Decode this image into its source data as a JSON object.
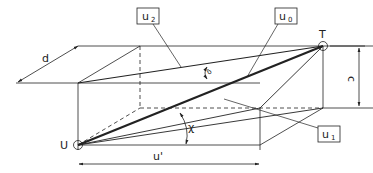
{
  "diagram": {
    "type": "3d-box-geometry",
    "points": {
      "start": "U",
      "end": "T"
    },
    "labels": {
      "u2_main": "u",
      "u2_sub": "2",
      "u0_main": "u",
      "u0_sub": "0",
      "u1_main": "u",
      "u1_sub": "1",
      "u_prime": "u'",
      "d": "d",
      "c": "c",
      "delta": "δ",
      "chi": "χ"
    },
    "colors": {
      "line": "#222222",
      "background": "#ffffff"
    }
  }
}
